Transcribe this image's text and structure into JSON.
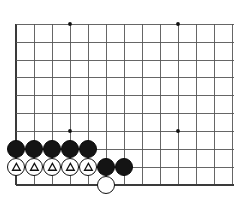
{
  "figure": {
    "kind": "go-board-diagram",
    "title": "Go board corner diagram",
    "width": 234,
    "height": 204
  },
  "board": {
    "background_color": "#ffffff",
    "line_color": "#555555",
    "edge_line_color": "#3a3a3a",
    "grid_spacing": 18,
    "origin_x": 16,
    "origin_y": 24,
    "columns": 13,
    "rows": 10,
    "left_edge_x": 16,
    "bottom_edge_y": 185,
    "edge_line_width": 2.2,
    "grid_line_width": 0.9,
    "star_point_radius": 1.9,
    "star_point_color": "#111111",
    "star_points": [
      {
        "name": "star-point-top-left",
        "x": 70,
        "y": 24
      },
      {
        "name": "star-point-top-right",
        "x": 178,
        "y": 24
      },
      {
        "name": "star-point-bottom-left",
        "x": 70,
        "y": 131
      },
      {
        "name": "star-point-bottom-right",
        "x": 178,
        "y": 131
      }
    ],
    "vertical_lines_x": [
      16,
      34,
      52,
      70,
      88,
      106,
      124,
      142,
      160,
      178,
      196,
      214,
      232
    ],
    "horizontal_lines_y": [
      24,
      42,
      60,
      77,
      95,
      113,
      131,
      149,
      167,
      185
    ]
  },
  "stones": {
    "radius": 9.4,
    "black_color": "#141414",
    "white_color": "#ffffff",
    "white_outline_color": "#111111",
    "mark_color": "#111111",
    "items": [
      {
        "name": "stone-black-a8",
        "color": "black",
        "x": 16,
        "y": 149,
        "mark": "none"
      },
      {
        "name": "stone-black-b8",
        "color": "black",
        "x": 34,
        "y": 149,
        "mark": "none"
      },
      {
        "name": "stone-black-c8",
        "color": "black",
        "x": 52,
        "y": 149,
        "mark": "none"
      },
      {
        "name": "stone-black-d8",
        "color": "black",
        "x": 70,
        "y": 149,
        "mark": "none"
      },
      {
        "name": "stone-black-e8",
        "color": "black",
        "x": 88,
        "y": 149,
        "mark": "none"
      },
      {
        "name": "stone-white-a9-triangle",
        "color": "white",
        "x": 16,
        "y": 167,
        "mark": "triangle"
      },
      {
        "name": "stone-white-b9-triangle",
        "color": "white",
        "x": 34,
        "y": 167,
        "mark": "triangle"
      },
      {
        "name": "stone-white-c9-triangle",
        "color": "white",
        "x": 52,
        "y": 167,
        "mark": "triangle"
      },
      {
        "name": "stone-white-d9-triangle",
        "color": "white",
        "x": 70,
        "y": 167,
        "mark": "triangle"
      },
      {
        "name": "stone-white-e9-triangle",
        "color": "white",
        "x": 88,
        "y": 167,
        "mark": "triangle"
      },
      {
        "name": "stone-black-f9",
        "color": "black",
        "x": 106,
        "y": 167,
        "mark": "none"
      },
      {
        "name": "stone-black-g9",
        "color": "black",
        "x": 124,
        "y": 167,
        "mark": "none"
      },
      {
        "name": "stone-white-f10",
        "color": "white",
        "x": 106,
        "y": 185,
        "mark": "none"
      }
    ]
  }
}
